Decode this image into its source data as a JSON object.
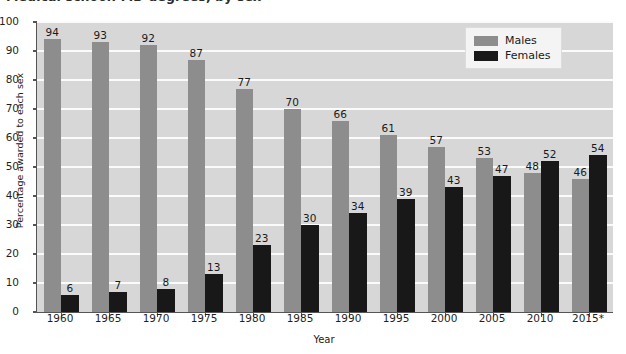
{
  "chart_data": {
    "type": "bar",
    "title": "Medical school: MD degrees, by sex",
    "xlabel": "Year",
    "ylabel": "Percentage awarded to each sex",
    "ylim": [
      0,
      100
    ],
    "ytick_step": 10,
    "yticks": [
      0,
      10,
      20,
      30,
      40,
      50,
      60,
      70,
      80,
      90,
      100
    ],
    "grid": true,
    "legend_position": "top-right",
    "categories": [
      "1960",
      "1965",
      "1970",
      "1975",
      "1980",
      "1985",
      "1990",
      "1995",
      "2000",
      "2005",
      "2010",
      "2015*"
    ],
    "series": [
      {
        "name": "Males",
        "color": "#8d8d8d",
        "values": [
          94,
          93,
          92,
          87,
          77,
          70,
          66,
          61,
          57,
          53,
          48,
          46
        ]
      },
      {
        "name": "Females",
        "color": "#181818",
        "values": [
          6,
          7,
          8,
          13,
          23,
          30,
          34,
          39,
          43,
          47,
          52,
          54
        ]
      }
    ]
  },
  "legend": {
    "items": [
      {
        "label": "Males",
        "swatch": "male"
      },
      {
        "label": "Females",
        "swatch": "female"
      }
    ]
  },
  "colors": {
    "male_bar": "#8d8d8d",
    "female_bar": "#181818",
    "plot_background": "#d7d7d7",
    "gridline": "#fbfbfb",
    "axis": "#555555"
  }
}
